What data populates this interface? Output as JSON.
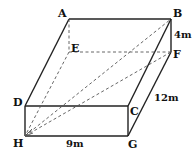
{
  "diagram": {
    "vertices": {
      "A": "A",
      "B": "B",
      "C": "C",
      "D": "D",
      "E": "E",
      "F": "F",
      "G": "G",
      "H": "H"
    },
    "dimensions": {
      "height": "4m",
      "depth": "12m",
      "width": "9m"
    }
  }
}
